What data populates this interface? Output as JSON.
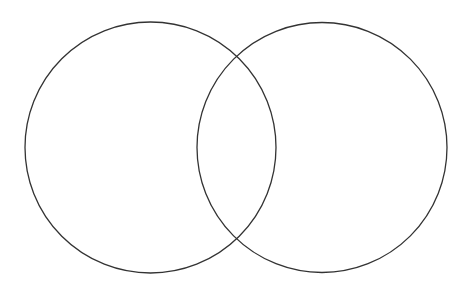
{
  "diagram": {
    "type": "venn",
    "background": "#ffffff",
    "stroke_color": "#333333",
    "stroke_width": 1.3,
    "circles": [
      {
        "id": "left",
        "cx": 150.5,
        "cy": 147.5,
        "r": 125.5
      },
      {
        "id": "right",
        "cx": 322,
        "cy": 147.5,
        "r": 125
      }
    ]
  }
}
